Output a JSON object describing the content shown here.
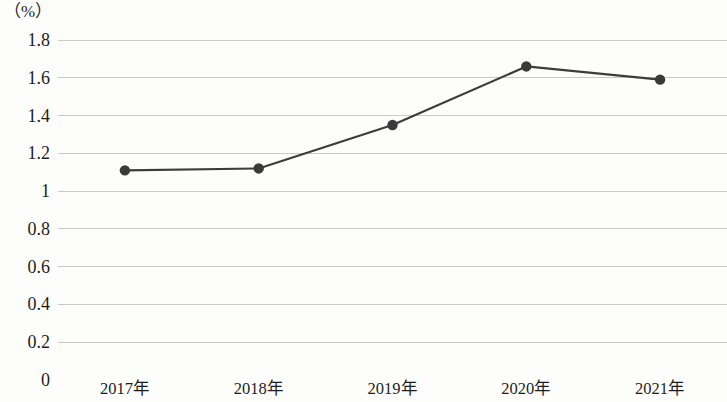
{
  "chart_data": {
    "type": "line",
    "title": "",
    "subtitle": "",
    "xlabel": "",
    "ylabel": "",
    "unit_label": "（%）",
    "categories": [
      "2017年",
      "2018年",
      "2019年",
      "2020年",
      "2021年"
    ],
    "values": [
      1.11,
      1.12,
      1.35,
      1.66,
      1.59
    ],
    "series": [
      {
        "name": "",
        "values": [
          1.11,
          1.12,
          1.35,
          1.66,
          1.59
        ]
      }
    ],
    "ylim": [
      0,
      1.8
    ],
    "ytick_step": 0.2,
    "ytick_labels": [
      "1.8",
      "1.6",
      "1.4",
      "1.2",
      "1",
      "0.8",
      "0.6",
      "0.4",
      "0.2",
      "0"
    ],
    "ytick_values": [
      1.8,
      1.6,
      1.4,
      1.2,
      1.0,
      0.8,
      0.6,
      0.4,
      0.2,
      0
    ],
    "grid": true,
    "grid_axis": "y",
    "legend": false,
    "legend_position": "none",
    "marker": "circle",
    "colors": {
      "line": "#3d3d3d",
      "marker": "#3a3a3a",
      "grid": "#c9c9c9",
      "text": "#1d1d1d",
      "background": "#fdfdfc"
    }
  }
}
